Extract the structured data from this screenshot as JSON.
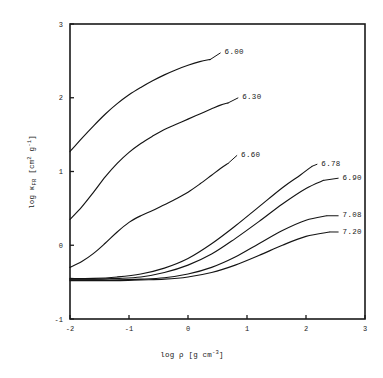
{
  "figure": {
    "background_color": "#ffffff",
    "line_color": "#141414",
    "axis_color": "#1a1a1a"
  },
  "chart_data": {
    "type": "line",
    "title": "",
    "subtitle": "",
    "xlabel": "log ρ [g cm⁻³]",
    "ylabel": "log κ_FR [cm² g⁻¹]",
    "ylabel_parts": {
      "prefix": "log ",
      "symbol": "κ",
      "subscript": "FR",
      "units": " [cm",
      "units_sup1": "2",
      "units_mid": " g",
      "units_sup2": "-1",
      "units_close": "]"
    },
    "xlabel_parts": {
      "prefix": "log ",
      "symbol": "ρ",
      "units": " [g cm",
      "units_sup": "-3",
      "units_close": "]"
    },
    "xlim": [
      -2,
      3
    ],
    "ylim": [
      -1,
      3
    ],
    "xticks": [
      -2,
      -1,
      0,
      1,
      2,
      3
    ],
    "xtick_labels": [
      "-2",
      "-1",
      "0",
      "1",
      "2",
      "3"
    ],
    "yticks": [
      -1,
      0,
      1,
      2,
      3
    ],
    "ytick_labels": [
      "-1",
      "0",
      "1",
      "2",
      "3"
    ],
    "grid": false,
    "legend_position": "inline-end-of-curve",
    "series_label_title": "log T",
    "series": [
      {
        "name": "6.00",
        "label": "6.00",
        "label_x": 0.62,
        "label_y": 2.63,
        "x": [
          -2.0,
          -1.8,
          -1.6,
          -1.4,
          -1.2,
          -1.0,
          -0.8,
          -0.6,
          -0.4,
          -0.2,
          0.0,
          0.2,
          0.38
        ],
        "y": [
          1.27,
          1.45,
          1.62,
          1.78,
          1.92,
          2.04,
          2.14,
          2.23,
          2.31,
          2.38,
          2.44,
          2.49,
          2.52
        ]
      },
      {
        "name": "6.30",
        "label": "6.30",
        "label_x": 0.92,
        "label_y": 2.02,
        "x": [
          -2.0,
          -1.8,
          -1.6,
          -1.4,
          -1.2,
          -1.0,
          -0.8,
          -0.6,
          -0.4,
          -0.2,
          0.0,
          0.2,
          0.4,
          0.55,
          0.68
        ],
        "y": [
          0.35,
          0.52,
          0.72,
          0.93,
          1.11,
          1.26,
          1.38,
          1.48,
          1.57,
          1.64,
          1.71,
          1.78,
          1.85,
          1.9,
          1.93
        ]
      },
      {
        "name": "6.60",
        "label": "6.60",
        "label_x": 0.9,
        "label_y": 1.24,
        "x": [
          -2.0,
          -1.8,
          -1.6,
          -1.4,
          -1.2,
          -1.0,
          -0.8,
          -0.6,
          -0.4,
          -0.2,
          0.0,
          0.2,
          0.4,
          0.55,
          0.68
        ],
        "y": [
          -0.3,
          -0.22,
          -0.11,
          0.03,
          0.18,
          0.31,
          0.4,
          0.47,
          0.55,
          0.63,
          0.72,
          0.83,
          0.95,
          1.04,
          1.11
        ]
      },
      {
        "name": "6.78",
        "label": "6.78",
        "label_x": 2.26,
        "label_y": 1.12,
        "x": [
          -2.0,
          -1.6,
          -1.2,
          -0.8,
          -0.4,
          0.0,
          0.4,
          0.8,
          1.2,
          1.6,
          1.9,
          2.1
        ],
        "y": [
          -0.45,
          -0.45,
          -0.43,
          -0.39,
          -0.31,
          -0.18,
          0.02,
          0.26,
          0.52,
          0.78,
          0.95,
          1.07
        ]
      },
      {
        "name": "6.90",
        "label": "6.90",
        "label_x": 2.62,
        "label_y": 0.93,
        "x": [
          -2.0,
          -1.6,
          -1.2,
          -0.8,
          -0.4,
          0.0,
          0.4,
          0.8,
          1.2,
          1.6,
          2.0,
          2.3
        ],
        "y": [
          -0.46,
          -0.46,
          -0.45,
          -0.43,
          -0.37,
          -0.27,
          -0.12,
          0.09,
          0.32,
          0.56,
          0.77,
          0.88
        ]
      },
      {
        "name": "7.08",
        "label": "7.08",
        "label_x": 2.62,
        "label_y": 0.42,
        "x": [
          -2.0,
          -1.6,
          -1.2,
          -0.8,
          -0.4,
          0.0,
          0.4,
          0.8,
          1.2,
          1.6,
          2.0,
          2.35
        ],
        "y": [
          -0.47,
          -0.47,
          -0.47,
          -0.46,
          -0.44,
          -0.39,
          -0.3,
          -0.16,
          0.02,
          0.2,
          0.34,
          0.4
        ]
      },
      {
        "name": "7.20",
        "label": "7.20",
        "label_x": 2.62,
        "label_y": 0.2,
        "x": [
          -2.0,
          -1.6,
          -1.2,
          -0.8,
          -0.4,
          0.0,
          0.4,
          0.8,
          1.2,
          1.6,
          2.0,
          2.4
        ],
        "y": [
          -0.48,
          -0.48,
          -0.48,
          -0.47,
          -0.46,
          -0.43,
          -0.37,
          -0.27,
          -0.14,
          0.0,
          0.12,
          0.18
        ]
      }
    ]
  }
}
